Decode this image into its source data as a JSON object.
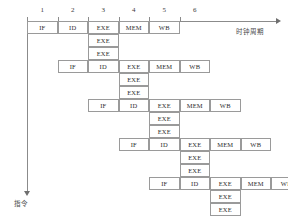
{
  "diagram": {
    "axis": {
      "x_label": "时钟周期",
      "y_label": "指令",
      "cycles": [
        "1",
        "2",
        "3",
        "4",
        "5",
        "6"
      ]
    },
    "stage_labels": {
      "if": "IF",
      "id": "ID",
      "exe": "EXE",
      "mem": "MEM",
      "wb": "WB"
    },
    "instructions": [
      {
        "index": 0,
        "start_cycle": 1,
        "stages": [
          "IF",
          "ID",
          "EXE",
          "MEM",
          "WB"
        ],
        "extra_exe": [
          "EXE",
          "EXE"
        ],
        "extra_exe_cycle": 3
      },
      {
        "index": 1,
        "start_cycle": 2,
        "stages": [
          "IF",
          "ID",
          "EXE",
          "MEM",
          "WB"
        ],
        "extra_exe": [
          "EXE",
          "EXE"
        ],
        "extra_exe_cycle": 4
      },
      {
        "index": 2,
        "start_cycle": 3,
        "stages": [
          "IF",
          "ID",
          "EXE",
          "MEM",
          "WB"
        ],
        "extra_exe": [
          "EXE",
          "EXE"
        ],
        "extra_exe_cycle": 5
      },
      {
        "index": 3,
        "start_cycle": 4,
        "stages": [
          "IF",
          "ID",
          "EXE",
          "MEM",
          "WB"
        ],
        "extra_exe": [
          "EXE",
          "EXE"
        ],
        "extra_exe_cycle": 6
      },
      {
        "index": 4,
        "start_cycle": 5,
        "stages": [
          "IF",
          "ID",
          "EXE",
          "MEM",
          "WB"
        ],
        "extra_exe": [
          "EXE",
          "EXE"
        ],
        "extra_exe_cycle": 7
      }
    ],
    "colors": {
      "cell_border": "#9a9a9a",
      "axis": "#8b8b8b",
      "text": "#2e2e2e"
    },
    "geometry": {
      "origin_x": 27,
      "origin_y": 21,
      "cell_width": 30.5,
      "row_height": 13,
      "rows_per_instruction": 3
    }
  }
}
